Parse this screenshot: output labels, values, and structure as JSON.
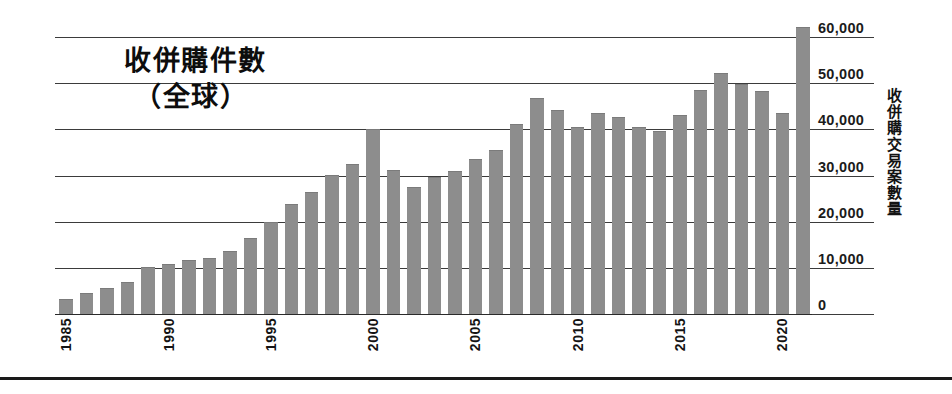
{
  "chart_data": {
    "type": "bar",
    "title_lines": [
      "收併購件數",
      "（全球）"
    ],
    "xlabel": "",
    "ylabel": "收併購交易案數量",
    "ylim": [
      0,
      65000
    ],
    "ytick_values": [
      0,
      10000,
      20000,
      30000,
      40000,
      50000,
      60000
    ],
    "ytick_labels": [
      "0",
      "10,000",
      "20,000",
      "30,000",
      "40,000",
      "50,000",
      "60,000"
    ],
    "grid": true,
    "legend": "none",
    "bar_color": "#8d8d8d",
    "categories": [
      "1985",
      "1986",
      "1987",
      "1988",
      "1989",
      "1990",
      "1991",
      "1992",
      "1993",
      "1994",
      "1995",
      "1996",
      "1997",
      "1998",
      "1999",
      "2000",
      "2001",
      "2002",
      "2003",
      "2004",
      "2005",
      "2006",
      "2007",
      "2008",
      "2009",
      "2010",
      "2011",
      "2012",
      "2013",
      "2014",
      "2015",
      "2016",
      "2017",
      "2018",
      "2019",
      "2020",
      "2021"
    ],
    "values": [
      3000,
      4300,
      5500,
      6800,
      10000,
      10600,
      11400,
      12000,
      13400,
      16200,
      19800,
      23600,
      26300,
      30000,
      32300,
      39800,
      30900,
      27300,
      29400,
      30800,
      33300,
      35300,
      41000,
      46500,
      44000,
      40200,
      43400,
      42500,
      40400,
      39400,
      42800,
      48400,
      51900,
      49500,
      48100,
      43400,
      62000
    ],
    "xtick_labels": [
      "1985",
      "1990",
      "1995",
      "2000",
      "2005",
      "2010",
      "2015",
      "2020"
    ],
    "xtick_indices": [
      0,
      5,
      10,
      15,
      20,
      25,
      30,
      35
    ]
  }
}
